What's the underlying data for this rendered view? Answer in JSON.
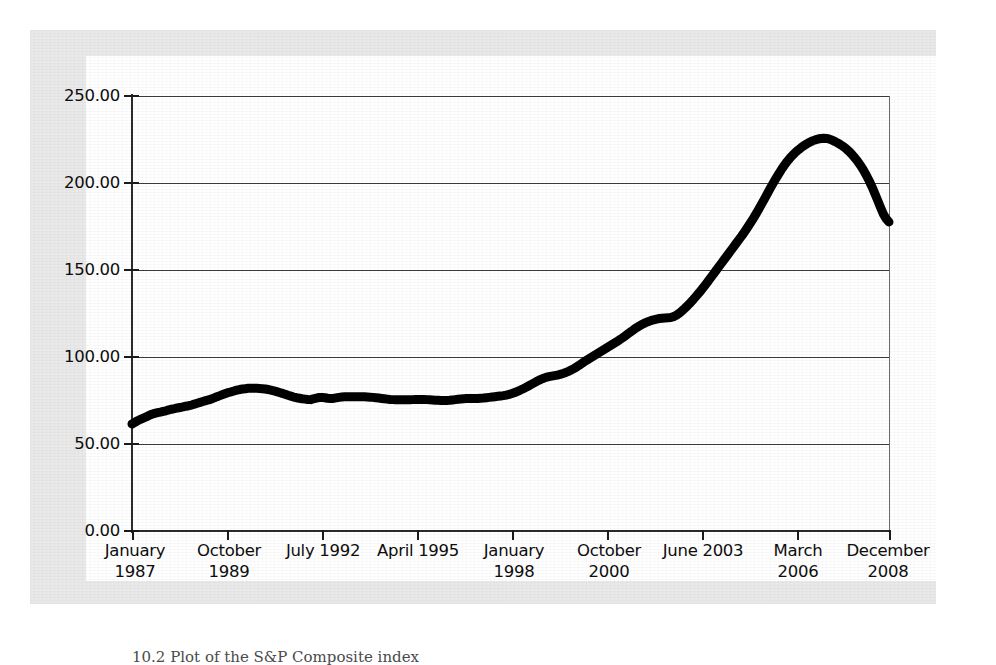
{
  "figure": {
    "caption": "10.2  Plot of the S&P Composite index",
    "background_color": "#ffffff",
    "frame_color": "#e9e9e9",
    "line_color": "#000000"
  },
  "chart_data": {
    "type": "line",
    "title": "",
    "xlabel": "",
    "ylabel": "",
    "ylim": [
      0,
      250
    ],
    "yticks": [
      "0.00",
      "50.00",
      "100.00",
      "150.00",
      "200.00",
      "250.00"
    ],
    "ytick_values": [
      0,
      50,
      100,
      150,
      200,
      250
    ],
    "grid": true,
    "grid_axis": "y",
    "legend": "none",
    "xticks": [
      {
        "line1": "January",
        "line2": "1987"
      },
      {
        "line1": "October",
        "line2": "1989"
      },
      {
        "line1": "July 1992",
        "line2": ""
      },
      {
        "line1": "April 1995",
        "line2": ""
      },
      {
        "line1": "January",
        "line2": "1998"
      },
      {
        "line1": "October",
        "line2": "2000"
      },
      {
        "line1": "June 2003",
        "line2": ""
      },
      {
        "line1": "March",
        "line2": "2006"
      },
      {
        "line1": "December",
        "line2": "2008"
      }
    ],
    "xtick_labels": [
      "January 1987",
      "October 1989",
      "July 1992",
      "April 1995",
      "January 1998",
      "October 2000",
      "June 2003",
      "March 2006",
      "December 2008"
    ],
    "x_index_range": [
      0,
      263
    ],
    "x_unit": "months since January 1987",
    "series": [
      {
        "name": "S&P Composite index",
        "values": [
          61.5,
          62.4,
          63.4,
          64.2,
          64.9,
          65.6,
          66.4,
          67.1,
          67.6,
          68.0,
          68.3,
          68.7,
          69.1,
          69.6,
          70.0,
          70.3,
          70.7,
          71.0,
          71.3,
          71.7,
          72.0,
          72.4,
          72.9,
          73.4,
          73.9,
          74.4,
          74.9,
          75.3,
          75.9,
          76.5,
          77.2,
          77.8,
          78.4,
          79.0,
          79.6,
          80.0,
          80.5,
          80.9,
          81.3,
          81.6,
          81.8,
          82.0,
          82.1,
          82.1,
          82.0,
          81.9,
          81.8,
          81.6,
          81.3,
          81.0,
          80.6,
          80.1,
          79.6,
          79.1,
          78.6,
          78.0,
          77.5,
          77.0,
          76.6,
          76.3,
          76.0,
          75.8,
          75.6,
          75.5,
          76.0,
          76.4,
          76.7,
          76.8,
          76.6,
          76.3,
          76.1,
          76.2,
          76.5,
          76.8,
          77.0,
          77.1,
          77.2,
          77.2,
          77.2,
          77.2,
          77.2,
          77.2,
          77.1,
          77.0,
          76.9,
          76.8,
          76.6,
          76.4,
          76.2,
          76.0,
          75.8,
          75.6,
          75.5,
          75.4,
          75.4,
          75.4,
          75.4,
          75.4,
          75.4,
          75.5,
          75.6,
          75.6,
          75.6,
          75.6,
          75.5,
          75.4,
          75.3,
          75.2,
          75.1,
          75.0,
          75.0,
          75.0,
          75.1,
          75.3,
          75.5,
          75.7,
          75.9,
          76.0,
          76.1,
          76.2,
          76.2,
          76.2,
          76.2,
          76.3,
          76.4,
          76.6,
          76.8,
          77.0,
          77.2,
          77.4,
          77.6,
          77.8,
          78.1,
          78.5,
          79.0,
          79.6,
          80.3,
          81.0,
          81.8,
          82.6,
          83.5,
          84.4,
          85.3,
          86.2,
          87.0,
          87.7,
          88.3,
          88.7,
          89.0,
          89.3,
          89.6,
          90.0,
          90.5,
          91.1,
          91.8,
          92.6,
          93.5,
          94.5,
          95.6,
          96.7,
          97.8,
          98.8,
          99.8,
          100.8,
          101.8,
          102.8,
          103.8,
          104.8,
          105.8,
          106.8,
          107.8,
          108.8,
          109.9,
          111.0,
          112.2,
          113.4,
          114.6,
          115.8,
          116.9,
          117.9,
          118.8,
          119.6,
          120.3,
          120.9,
          121.4,
          121.8,
          122.1,
          122.3,
          122.4,
          122.5,
          122.7,
          123.2,
          124.0,
          125.1,
          126.5,
          128.0,
          129.6,
          131.3,
          133.1,
          135.0,
          136.9,
          138.9,
          141.0,
          143.1,
          145.3,
          147.5,
          149.7,
          151.9,
          154.1,
          156.3,
          158.5,
          160.7,
          162.9,
          165.1,
          167.3,
          169.5,
          171.8,
          174.2,
          176.7,
          179.3,
          182.0,
          184.8,
          187.7,
          190.6,
          193.6,
          196.6,
          199.5,
          202.3,
          205.0,
          207.6,
          210.0,
          212.2,
          214.2,
          216.0,
          217.6,
          219.0,
          220.3,
          221.5,
          222.5,
          223.4,
          224.2,
          224.8,
          225.3,
          225.6,
          225.7,
          225.6,
          225.2,
          224.6,
          223.8,
          222.9,
          221.9,
          220.8,
          219.5,
          218.0,
          216.3,
          214.4,
          212.3,
          210.0,
          207.4,
          204.5,
          201.3,
          197.8,
          194.0,
          190.0,
          186.0,
          182.2,
          179.4,
          177.6
        ]
      }
    ]
  }
}
